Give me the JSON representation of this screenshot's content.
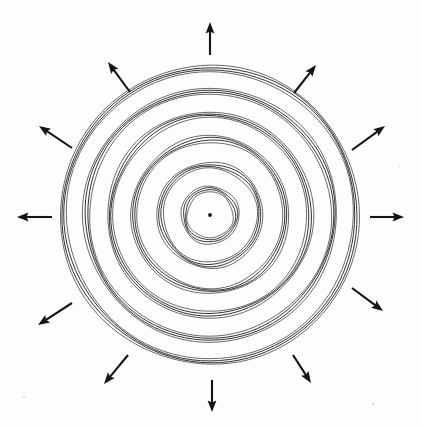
{
  "figure": {
    "caption": "",
    "background_color": "#fdfdfc",
    "ink_color": "#141414",
    "canvas": {
      "width": 422,
      "height": 428
    }
  },
  "chart_data": {
    "type": "scatter",
    "subtitle": "",
    "xlabel": "",
    "ylabel": "",
    "grid": false,
    "legend": null,
    "axis_ranges": {
      "xlim": [
        0,
        422
      ],
      "ylim": [
        0,
        428
      ]
    },
    "center": {
      "x": 210,
      "y": 215,
      "dot_radius": 1.9
    },
    "ring_band_count": 6,
    "lines_per_band": 4,
    "band_line_gap_px": 2.0,
    "band_mean_radii": [
      26,
      50,
      76,
      100,
      124,
      147
    ],
    "bands": [
      {
        "index": 1,
        "mean_radius": 26,
        "line_radii": [
          23.0,
          25.0,
          27.0,
          29.0
        ]
      },
      {
        "index": 2,
        "mean_radius": 50,
        "line_radii": [
          47.0,
          49.0,
          51.0,
          53.0
        ]
      },
      {
        "index": 3,
        "mean_radius": 76,
        "line_radii": [
          73.0,
          75.0,
          77.0,
          79.0
        ]
      },
      {
        "index": 4,
        "mean_radius": 100,
        "line_radii": [
          97.0,
          99.0,
          101.0,
          103.0
        ]
      },
      {
        "index": 5,
        "mean_radius": 124,
        "line_radii": [
          121.0,
          123.0,
          125.0,
          127.0
        ]
      },
      {
        "index": 6,
        "mean_radius": 147,
        "line_radii": [
          143.5,
          145.5,
          147.5,
          149.5
        ]
      }
    ],
    "ellipse_aspect": {
      "rx_scale": 1.0,
      "ry_scale": 1.0
    },
    "arrow_count": 12,
    "arrow_angle_step_deg": 30,
    "arrow_direction": "outward-radial",
    "arrow_length_px": 34,
    "arrow_tail_radius_px": 168,
    "arrows": [
      {
        "label": "arrow-up",
        "angle_deg": 90,
        "tail": {
          "x": 210,
          "y": 55
        },
        "tip": {
          "x": 210,
          "y": 22
        }
      },
      {
        "label": "arrow-up-right-1",
        "angle_deg": 60,
        "tail": {
          "x": 294,
          "y": 93
        },
        "tip": {
          "x": 316,
          "y": 65
        }
      },
      {
        "label": "arrow-up-right-2",
        "angle_deg": 30,
        "tail": {
          "x": 352,
          "y": 150
        },
        "tip": {
          "x": 385,
          "y": 126
        }
      },
      {
        "label": "arrow-right",
        "angle_deg": 0,
        "tail": {
          "x": 370,
          "y": 217
        },
        "tip": {
          "x": 404,
          "y": 217
        }
      },
      {
        "label": "arrow-down-right-1",
        "angle_deg": -30,
        "tail": {
          "x": 352,
          "y": 288
        },
        "tip": {
          "x": 383,
          "y": 311
        }
      },
      {
        "label": "arrow-down-right-2",
        "angle_deg": -60,
        "tail": {
          "x": 293,
          "y": 355
        },
        "tip": {
          "x": 311,
          "y": 383
        }
      },
      {
        "label": "arrow-down",
        "angle_deg": -90,
        "tail": {
          "x": 212,
          "y": 380
        },
        "tip": {
          "x": 212,
          "y": 412
        }
      },
      {
        "label": "arrow-down-left-1",
        "angle_deg": -120,
        "tail": {
          "x": 128,
          "y": 355
        },
        "tip": {
          "x": 104,
          "y": 384
        }
      },
      {
        "label": "arrow-down-left-2",
        "angle_deg": -150,
        "tail": {
          "x": 72,
          "y": 303
        },
        "tip": {
          "x": 38,
          "y": 325
        }
      },
      {
        "label": "arrow-left",
        "angle_deg": 180,
        "tail": {
          "x": 52,
          "y": 217
        },
        "tip": {
          "x": 17,
          "y": 217
        }
      },
      {
        "label": "arrow-up-left-1",
        "angle_deg": 150,
        "tail": {
          "x": 72,
          "y": 148
        },
        "tip": {
          "x": 39,
          "y": 126
        }
      },
      {
        "label": "arrow-up-left-2",
        "angle_deg": 120,
        "tail": {
          "x": 130,
          "y": 92
        },
        "tip": {
          "x": 108,
          "y": 62
        }
      }
    ]
  }
}
